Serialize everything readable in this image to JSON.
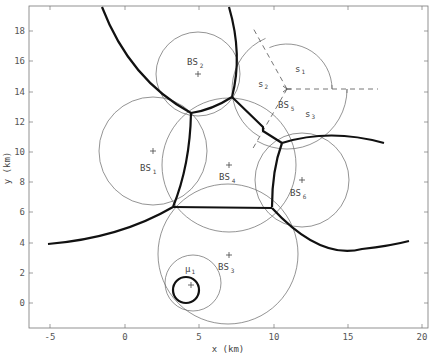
{
  "figure": {
    "xlabel": "x (km)",
    "ylabel": "y (km)",
    "xticks": [
      "-5",
      "0",
      "5",
      "10",
      "15",
      "20"
    ],
    "yticks": [
      "0",
      "2",
      "4",
      "6",
      "8",
      "10",
      "12",
      "14",
      "16",
      "18"
    ],
    "xlim": [
      -6,
      20.3
    ],
    "ylim": [
      -1.7,
      19.5
    ]
  },
  "base_stations": [
    {
      "name": "BS",
      "sub": "1",
      "x": 1.9,
      "y": 10.0,
      "radius_km": 3.6
    },
    {
      "name": "BS",
      "sub": "2",
      "x": 4.9,
      "y": 15.1,
      "radius_km": 2.8
    },
    {
      "name": "BS",
      "sub": "3",
      "x": 6.9,
      "y": 3.2,
      "radius_km": 4.7
    },
    {
      "name": "BS",
      "sub": "4",
      "x": 6.9,
      "y": 9.1,
      "radius_km": 4.5
    },
    {
      "name": "BS",
      "sub": "5",
      "x": 10.9,
      "y": 14.1,
      "sectored": true
    },
    {
      "name": "BS",
      "sub": "6",
      "x": 11.9,
      "y": 8.2,
      "radius_km": 3.1
    }
  ],
  "sectors": [
    {
      "name": "s",
      "sub": "1"
    },
    {
      "name": "s",
      "sub": "2"
    },
    {
      "name": "s",
      "sub": "3"
    }
  ],
  "user": {
    "name": "μ",
    "sub": "1",
    "x": 4.4,
    "y": 1.1
  }
}
